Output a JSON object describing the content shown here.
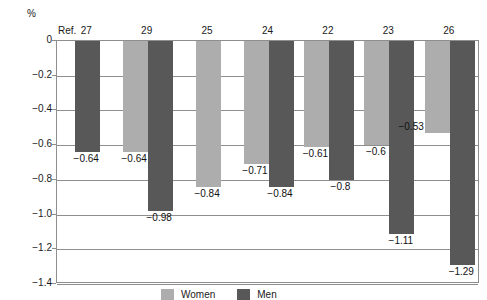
{
  "chart_data": {
    "type": "bar",
    "title": "",
    "subtitle": "",
    "xlabel": "",
    "ylabel": "%",
    "unit_label": "%",
    "ref_prefix": "Ref.",
    "ylim": [
      -1.4,
      0
    ],
    "yticks": [
      "0",
      "−0.2",
      "−0.4",
      "−0.6",
      "−0.8",
      "−1.0",
      "−1.2",
      "−1.4"
    ],
    "ytick_values": [
      0,
      -0.2,
      -0.4,
      -0.6,
      -0.8,
      -1.0,
      -1.2,
      -1.4
    ],
    "grid": true,
    "legend_position": "inside-bottom-left",
    "categories": [
      "27",
      "29",
      "25",
      "24",
      "22",
      "23",
      "26"
    ],
    "series": [
      {
        "name": "Women",
        "color": "#adadad",
        "values": [
          null,
          -0.64,
          -0.84,
          -0.71,
          -0.61,
          -0.6,
          -0.53
        ],
        "labels": [
          "",
          "−0.64",
          "−0.84",
          "−0.71",
          "−0.61",
          "−0.6",
          "−0.53"
        ]
      },
      {
        "name": "Men",
        "color": "#585858",
        "values": [
          -0.64,
          -0.98,
          null,
          -0.84,
          -0.8,
          -1.11,
          -1.29
        ],
        "labels": [
          "−0.64",
          "−0.98",
          "",
          "−0.84",
          "−0.8",
          "−1.11",
          "−1.29"
        ]
      }
    ]
  },
  "legend": {
    "items": [
      {
        "label": "Women",
        "color": "#adadad",
        "swatch": "women-swatch"
      },
      {
        "label": "Men",
        "color": "#585858",
        "swatch": "men-swatch"
      }
    ]
  },
  "axis": {
    "unit": "%",
    "ref_prefix": "Ref."
  }
}
